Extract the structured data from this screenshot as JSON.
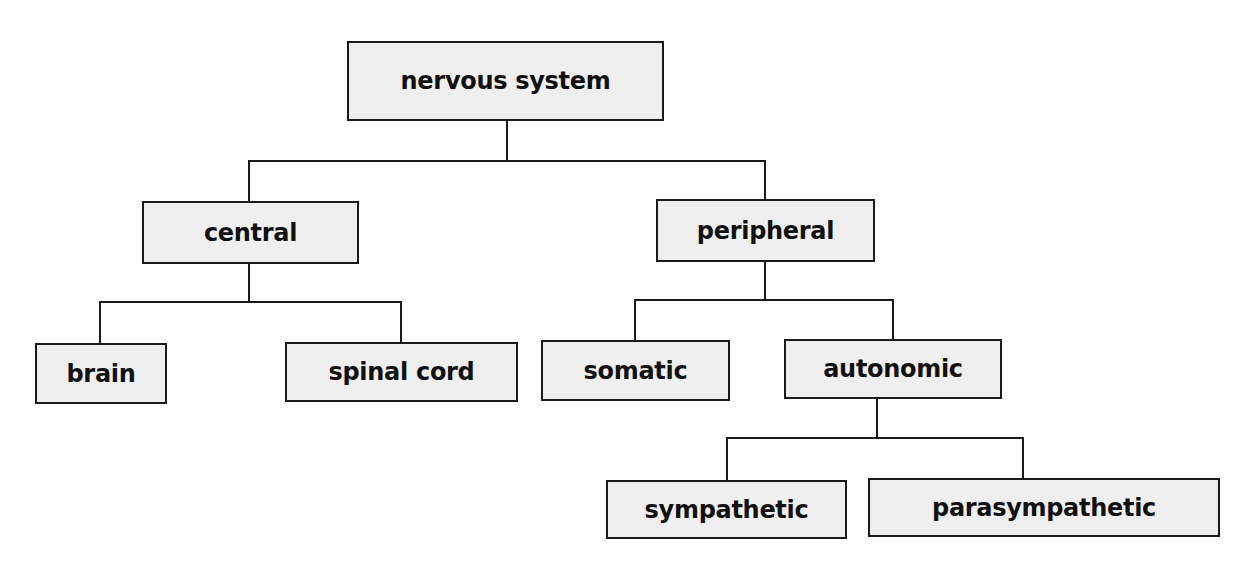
{
  "diagram": {
    "type": "tree",
    "nodes": {
      "root": {
        "label": "nervous system"
      },
      "central": {
        "label": "central"
      },
      "peripheral": {
        "label": "peripheral"
      },
      "brain": {
        "label": "brain"
      },
      "spinal_cord": {
        "label": "spinal cord"
      },
      "somatic": {
        "label": "somatic"
      },
      "autonomic": {
        "label": "autonomic"
      },
      "sympathetic": {
        "label": "sympathetic"
      },
      "parasympathetic": {
        "label": "parasympathetic"
      }
    },
    "edges": [
      [
        "nervous system",
        "central"
      ],
      [
        "nervous system",
        "peripheral"
      ],
      [
        "central",
        "brain"
      ],
      [
        "central",
        "spinal cord"
      ],
      [
        "peripheral",
        "somatic"
      ],
      [
        "peripheral",
        "autonomic"
      ],
      [
        "autonomic",
        "sympathetic"
      ],
      [
        "autonomic",
        "parasympathetic"
      ]
    ],
    "colors": {
      "box_fill": "#efefef",
      "stroke": "#1a1a1a",
      "text": "#111111",
      "background": "#ffffff"
    }
  }
}
